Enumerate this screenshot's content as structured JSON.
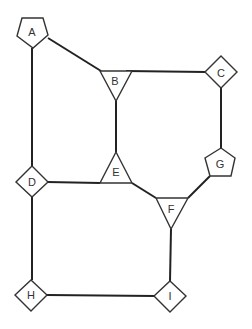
{
  "diagram": {
    "type": "graph",
    "nodes": [
      {
        "id": "A",
        "label": "A",
        "shape": "pentagon"
      },
      {
        "id": "B",
        "label": "B",
        "shape": "triangle-down"
      },
      {
        "id": "C",
        "label": "C",
        "shape": "diamond"
      },
      {
        "id": "D",
        "label": "D",
        "shape": "diamond"
      },
      {
        "id": "E",
        "label": "E",
        "shape": "triangle-up"
      },
      {
        "id": "F",
        "label": "F",
        "shape": "triangle-down"
      },
      {
        "id": "G",
        "label": "G",
        "shape": "pentagon"
      },
      {
        "id": "H",
        "label": "H",
        "shape": "diamond"
      },
      {
        "id": "I",
        "label": "I",
        "shape": "diamond"
      }
    ],
    "edges": [
      [
        "A",
        "B"
      ],
      [
        "A",
        "D"
      ],
      [
        "B",
        "C"
      ],
      [
        "B",
        "E"
      ],
      [
        "C",
        "G"
      ],
      [
        "D",
        "E"
      ],
      [
        "D",
        "H"
      ],
      [
        "E",
        "F"
      ],
      [
        "F",
        "G"
      ],
      [
        "F",
        "I"
      ],
      [
        "H",
        "I"
      ]
    ]
  }
}
